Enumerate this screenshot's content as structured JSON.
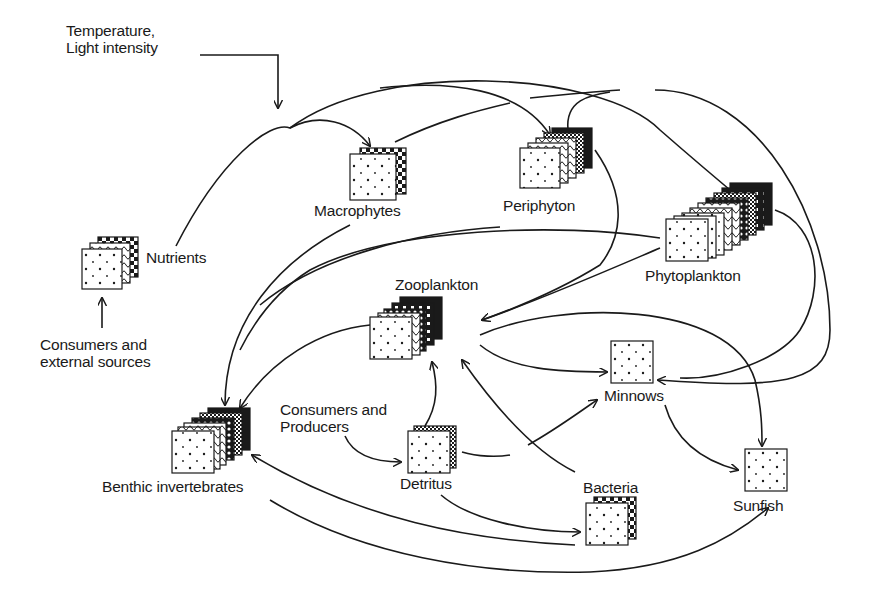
{
  "colors": {
    "ink": "#1a1a1a",
    "background": "#ffffff"
  },
  "labels": {
    "temperature": "Temperature,\nLight intensity",
    "nutrients": "Nutrients",
    "consumers_external": "Consumers and\nexternal sources",
    "macrophytes": "Macrophytes",
    "periphyton": "Periphyton",
    "phytoplankton": "Phytoplankton",
    "zooplankton": "Zooplankton",
    "consumers_producers": "Consumers and\nProducers",
    "benthic": "Benthic invertebrates",
    "detritus": "Detritus",
    "bacteria": "Bacteria",
    "minnows": "Minnows",
    "sunfish": "Sunfish"
  },
  "nodes": [
    {
      "id": "nutrients",
      "label": "Nutrients",
      "layers": 3,
      "icon": "stacked-pattern-cards"
    },
    {
      "id": "macrophytes",
      "label": "Macrophytes",
      "layers": 2,
      "icon": "stacked-pattern-cards"
    },
    {
      "id": "periphyton",
      "label": "Periphyton",
      "layers": 5,
      "icon": "stacked-pattern-cards"
    },
    {
      "id": "phytoplankton",
      "label": "Phytoplankton",
      "layers": 8,
      "icon": "stacked-pattern-cards"
    },
    {
      "id": "zooplankton",
      "label": "Zooplankton",
      "layers": 5,
      "icon": "stacked-pattern-cards"
    },
    {
      "id": "benthic",
      "label": "Benthic invertebrates",
      "layers": 6,
      "icon": "stacked-pattern-cards"
    },
    {
      "id": "detritus",
      "label": "Detritus",
      "layers": 2,
      "icon": "stacked-pattern-cards"
    },
    {
      "id": "bacteria",
      "label": "Bacteria",
      "layers": 2,
      "icon": "stacked-pattern-cards"
    },
    {
      "id": "minnows",
      "label": "Minnows",
      "layers": 1,
      "icon": "dotted-card"
    },
    {
      "id": "sunfish",
      "label": "Sunfish",
      "layers": 1,
      "icon": "dotted-card"
    }
  ],
  "external_inputs": [
    {
      "label": "Temperature, Light intensity",
      "target": "system"
    },
    {
      "label": "Consumers and external sources",
      "target": "nutrients"
    },
    {
      "label": "Consumers and Producers",
      "target": "detritus"
    }
  ],
  "edges": [
    {
      "from": "nutrients",
      "to": "macrophytes"
    },
    {
      "from": "nutrients",
      "to": "periphyton"
    },
    {
      "from": "nutrients",
      "to": "phytoplankton"
    },
    {
      "from": "macrophytes",
      "to": "periphyton"
    },
    {
      "from": "periphyton",
      "to": "phytoplankton"
    },
    {
      "from": "phytoplankton",
      "to": "minnows"
    },
    {
      "from": "periphyton",
      "to": "zooplankton"
    },
    {
      "from": "phytoplankton",
      "to": "zooplankton"
    },
    {
      "from": "macrophytes",
      "to": "benthic"
    },
    {
      "from": "periphyton",
      "to": "benthic"
    },
    {
      "from": "phytoplankton",
      "to": "benthic"
    },
    {
      "from": "zooplankton",
      "to": "benthic"
    },
    {
      "from": "zooplankton",
      "to": "minnows"
    },
    {
      "from": "zooplankton",
      "to": "sunfish"
    },
    {
      "from": "detritus",
      "to": "zooplankton"
    },
    {
      "from": "bacteria",
      "to": "zooplankton"
    },
    {
      "from": "detritus",
      "to": "minnows"
    },
    {
      "from": "detritus",
      "to": "bacteria"
    },
    {
      "from": "bacteria",
      "to": "benthic"
    },
    {
      "from": "benthic",
      "to": "sunfish"
    },
    {
      "from": "minnows",
      "to": "sunfish"
    }
  ]
}
